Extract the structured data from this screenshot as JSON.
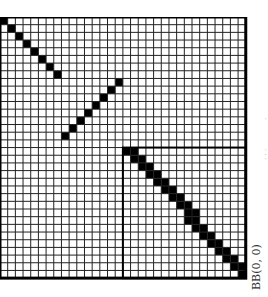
{
  "diagram": {
    "grid": {
      "cols": 32,
      "rows": 34,
      "cell_px": 7.68,
      "origin_x": 0,
      "origin_y": 17,
      "line_color": "#222222",
      "fill_color": "#000000",
      "background": "#ffffff"
    },
    "filled_paths": [
      {
        "name": "diagonal-top-left",
        "cells": [
          [
            0,
            0
          ],
          [
            1,
            1
          ],
          [
            2,
            2
          ],
          [
            3,
            3
          ],
          [
            4,
            4
          ],
          [
            5,
            5
          ],
          [
            6,
            6
          ],
          [
            7,
            7
          ]
        ]
      },
      {
        "name": "anti-diagonal-middle",
        "cells": [
          [
            15,
            8
          ],
          [
            14,
            9
          ],
          [
            13,
            10
          ],
          [
            12,
            11
          ],
          [
            11,
            12
          ],
          [
            10,
            13
          ],
          [
            9,
            14
          ],
          [
            8,
            15
          ]
        ]
      },
      {
        "name": "thick-diagonal-box",
        "start": [
          16,
          17
        ],
        "end": [
          31,
          33
        ],
        "thickness": 2
      }
    ],
    "box": {
      "col": 16,
      "row": 17,
      "to_col": 32,
      "to_row": 34
    },
    "labels": {
      "corner_label": "BB(0, 0)",
      "faint_top": "·",
      "faint_bottom": "· · ·"
    }
  }
}
